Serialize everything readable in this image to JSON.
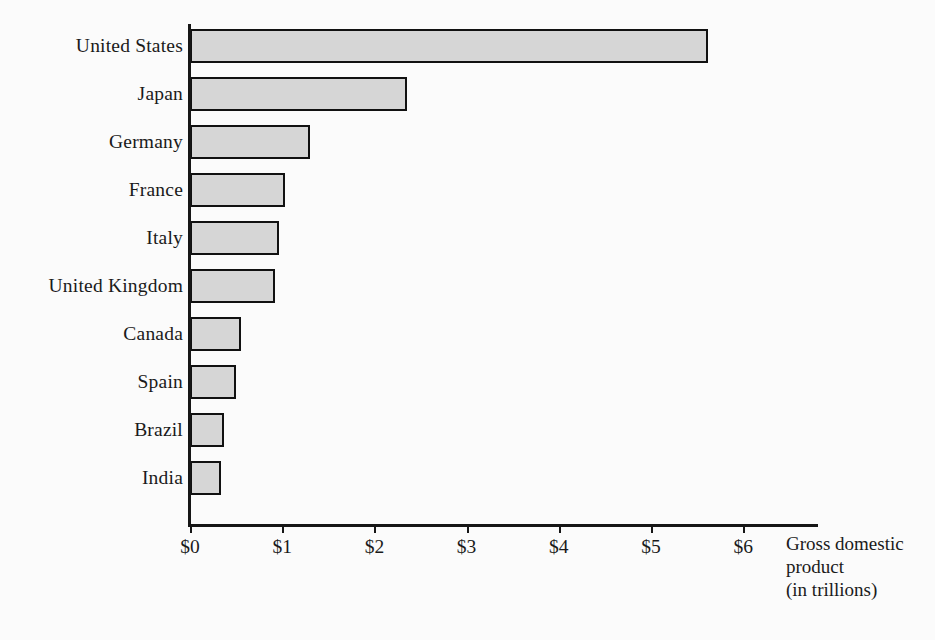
{
  "chart_data": {
    "type": "bar",
    "orientation": "horizontal",
    "title": "",
    "xlabel": "Gross domestic product (in trillions)",
    "ylabel": "",
    "xlim": [
      0,
      6.9
    ],
    "grid": false,
    "legend": null,
    "categories": [
      "United States",
      "Japan",
      "Germany",
      "France",
      "Italy",
      "United Kingdom",
      "Canada",
      "Spain",
      "Brazil",
      "India"
    ],
    "values": [
      5.62,
      2.35,
      1.3,
      1.03,
      0.96,
      0.92,
      0.55,
      0.5,
      0.37,
      0.34
    ],
    "tick_values": [
      0,
      1,
      2,
      3,
      4,
      5,
      6
    ],
    "tick_labels": [
      "$0",
      "$1",
      "$2",
      "$3",
      "$4",
      "$5",
      "$6"
    ],
    "axis_title_lines": [
      "Gross domestic",
      "product",
      "(in trillions)"
    ],
    "bar_fill_color": "#d6d6d6",
    "bar_border_color": "#111111",
    "axis_color": "#161616",
    "background_color": "#fbfbfb"
  }
}
